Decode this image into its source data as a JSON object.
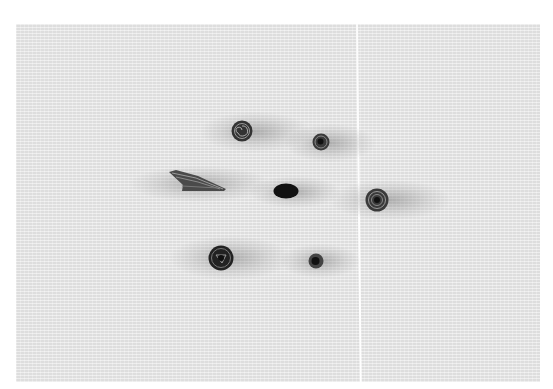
{
  "scene": {
    "description": "Grayscale photo of quilled paper shapes (coils, oval and a wing shape) on textured paper",
    "background_color": "#ffffff",
    "paper_color": "#e9e9e9",
    "object_color": "#2a2a2a"
  },
  "objects": [
    {
      "type": "coil",
      "name": "top-left-coil",
      "cx": 242,
      "cy": 131,
      "r": 11
    },
    {
      "type": "coil",
      "name": "top-right-coil",
      "cx": 321,
      "cy": 142,
      "r": 9
    },
    {
      "type": "wing",
      "name": "wing-shape",
      "x": 168,
      "y": 169,
      "w": 60,
      "h": 24
    },
    {
      "type": "oval",
      "name": "center-oval",
      "cx": 286,
      "cy": 191,
      "rx": 13,
      "ry": 8
    },
    {
      "type": "coil",
      "name": "right-coil",
      "cx": 377,
      "cy": 200,
      "r": 12
    },
    {
      "type": "coil",
      "name": "bottom-left-coil",
      "cx": 221,
      "cy": 258,
      "r": 13
    },
    {
      "type": "coil",
      "name": "bottom-right-coil",
      "cx": 316,
      "cy": 261,
      "r": 8
    }
  ]
}
